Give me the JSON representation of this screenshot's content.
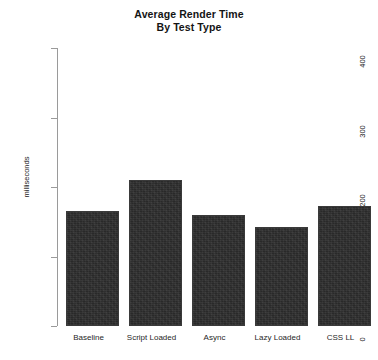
{
  "chart_data": {
    "type": "bar",
    "title": "Average Render Time",
    "subtitle": "By Test Type",
    "xlabel": "",
    "ylabel": "milliseconds",
    "categories": [
      "Baseline",
      "Script Loaded",
      "Async",
      "Lazy Loaded",
      "CSS LL"
    ],
    "values": [
      165,
      210,
      160,
      143,
      172
    ],
    "ylim": [
      0,
      400
    ],
    "yticks": [
      0,
      100,
      200,
      300,
      400
    ],
    "ytick_labels": [
      "0",
      "100",
      "200",
      "300",
      "400"
    ],
    "grid": false,
    "legend": false,
    "bar_color": "#2e2e2e",
    "background_color": "#ffffff",
    "axis_color": "#9a9a9a"
  }
}
